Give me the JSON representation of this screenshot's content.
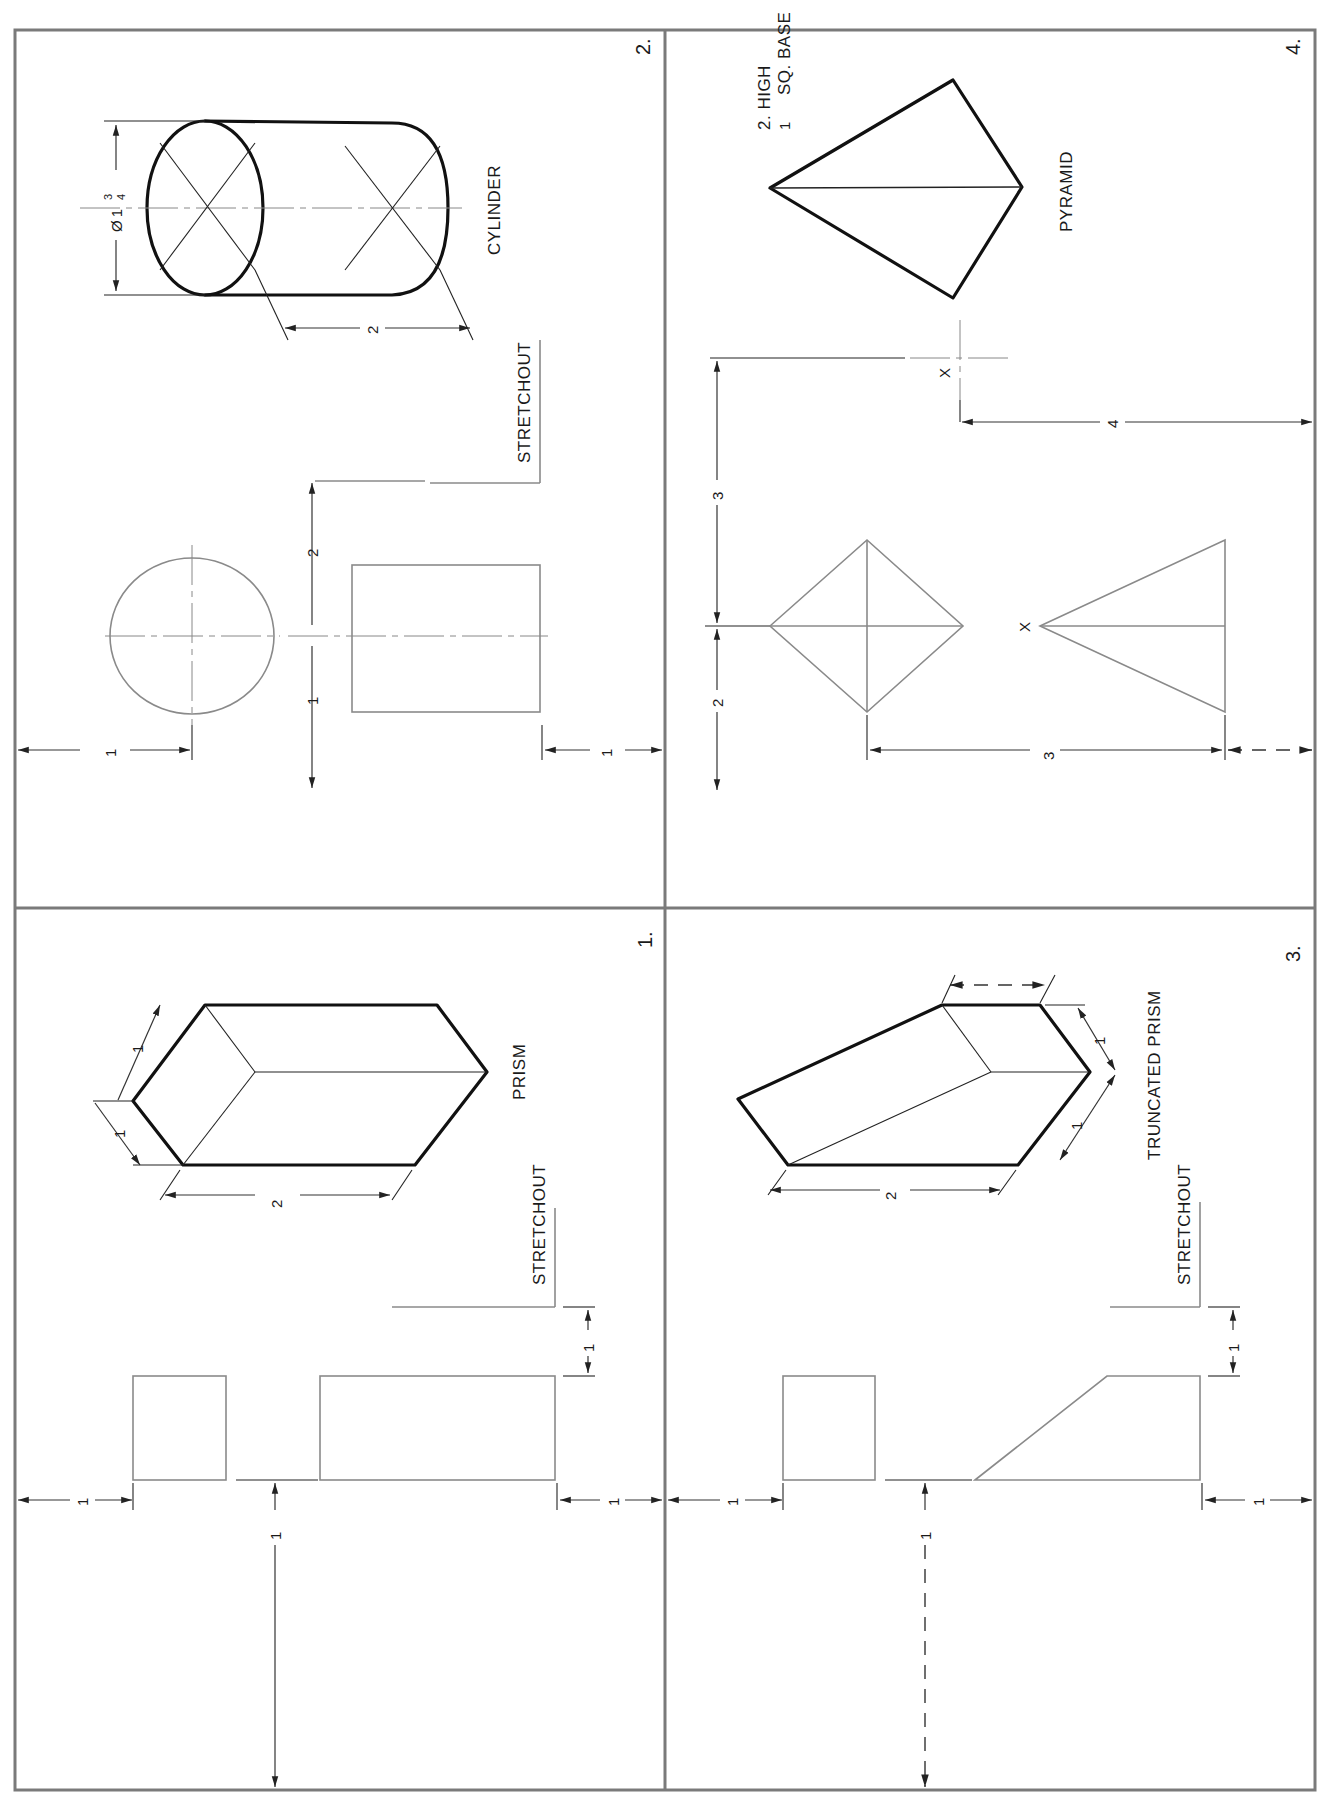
{
  "sheet": {
    "panels": [
      {
        "number": "1.",
        "title": "PRISM",
        "stretchout_label": "STRETCHOUT",
        "pictorial_dims": {
          "width_a": "1",
          "width_b": "1 1/2",
          "height": "2 1/2"
        },
        "layout_dims": {
          "left_margin": "1 1/4",
          "bottom_gap": "1 1/8",
          "right_margin": "1 1/4",
          "stretchout_offset": "1 3/16"
        }
      },
      {
        "number": "2.",
        "title": "CYLINDER",
        "stretchout_label": "STRETCHOUT",
        "pictorial_dims": {
          "diameter": "Ø 1 3/4",
          "length": "2"
        },
        "layout_dims": {
          "left_margin": "1 1/2",
          "center_to_stretchout": "2",
          "center_offset": "1 3/4",
          "right_margin": "1 3/4"
        }
      },
      {
        "number": "3.",
        "title": "TRUNCATED PRISM",
        "stretchout_label": "STRETCHOUT",
        "pictorial_dims": {
          "width_a": "1",
          "width_b": "1 1/2",
          "height": "2 1/2",
          "top_edge": "—"
        },
        "layout_dims": {
          "left_margin": "1 1/4",
          "bottom_gap": "1 1/8",
          "right_margin": "1 1/4",
          "stretchout_offset": "1 3/16"
        }
      },
      {
        "number": "4.",
        "title": "PYRAMID",
        "spec_line1": "2. HIGH",
        "spec_line2": "1 1/2 SQ. BASE",
        "marker": "X",
        "layout_dims": {
          "top_offset": "3 1/4",
          "bottom_offset": "2 1/2",
          "to_apex": "4",
          "plan_to_elev": "3 7/8"
        }
      }
    ],
    "text": {
      "p1_num": "1.",
      "p1_title": "PRISM",
      "p1_stretch": "STRETCHOUT",
      "p2_num": "2.",
      "p2_title": "CYLINDER",
      "p2_stretch": "STRETCHOUT",
      "p3_num": "3.",
      "p3_title": "TRUNCATED PRISM",
      "p3_stretch": "STRETCHOUT",
      "p4_num": "4.",
      "p4_title": "PYRAMID",
      "p4_spec1": "2. HIGH",
      "p4_spec2": "SQ. BASE",
      "p4_spec2_whole": "1",
      "x_mark": "X",
      "d_1": "1",
      "d_2": "2",
      "d_3": "3",
      "d_4": "4",
      "f_1": "1",
      "f_2": "2",
      "f_3": "3",
      "f_4": "4",
      "f_7": "7",
      "f_8": "8",
      "f_16": "16",
      "phi": "Ø"
    }
  }
}
